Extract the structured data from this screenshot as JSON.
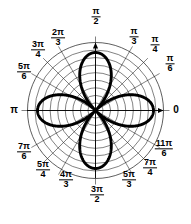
{
  "figure": {
    "title": "",
    "kind": "polar-rose-plot"
  },
  "axis_labels": [
    {
      "name": "angle-label-0",
      "text_type": "plain",
      "text": "0",
      "angle_deg": 0,
      "x": 176,
      "y": 110
    },
    {
      "name": "angle-label-pi-6",
      "text_type": "frac",
      "num": "π",
      "den": "6",
      "angle_deg": 30,
      "x": 170,
      "y": 64
    },
    {
      "name": "angle-label-pi-4",
      "text_type": "frac",
      "num": "π",
      "den": "4",
      "angle_deg": 45,
      "x": 155,
      "y": 45
    },
    {
      "name": "angle-label-pi-3",
      "text_type": "frac",
      "num": "π",
      "den": "3",
      "angle_deg": 60,
      "x": 134,
      "y": 37
    },
    {
      "name": "angle-label-pi-2",
      "text_type": "frac",
      "num": "π",
      "den": "2",
      "angle_deg": 90,
      "x": 96,
      "y": 17
    },
    {
      "name": "angle-label-2pi-3",
      "text_type": "frac",
      "num": "2π",
      "den": "3",
      "angle_deg": 120,
      "x": 58,
      "y": 38
    },
    {
      "name": "angle-label-3pi-4",
      "text_type": "frac",
      "num": "3π",
      "den": "4",
      "angle_deg": 135,
      "x": 38,
      "y": 50
    },
    {
      "name": "angle-label-5pi-6",
      "text_type": "frac",
      "num": "5π",
      "den": "6",
      "angle_deg": 150,
      "x": 24,
      "y": 72
    },
    {
      "name": "angle-label-pi",
      "text_type": "plain",
      "text": "π",
      "angle_deg": 180,
      "x": 14,
      "y": 110
    },
    {
      "name": "angle-label-7pi-6",
      "text_type": "frac",
      "num": "7π",
      "den": "6",
      "angle_deg": 210,
      "x": 24,
      "y": 152
    },
    {
      "name": "angle-label-5pi-4",
      "text_type": "frac",
      "num": "5π",
      "den": "4",
      "angle_deg": 225,
      "x": 43,
      "y": 170
    },
    {
      "name": "angle-label-4pi-3",
      "text_type": "frac",
      "num": "4π",
      "den": "3",
      "angle_deg": 240,
      "x": 66,
      "y": 180
    },
    {
      "name": "angle-label-3pi-2",
      "text_type": "frac",
      "num": "3π",
      "den": "2",
      "angle_deg": 270,
      "x": 97,
      "y": 195
    },
    {
      "name": "angle-label-5pi-3",
      "text_type": "frac",
      "num": "5π",
      "den": "3",
      "angle_deg": 300,
      "x": 129,
      "y": 180
    },
    {
      "name": "angle-label-7pi-4",
      "text_type": "frac",
      "num": "7π",
      "den": "4",
      "angle_deg": 315,
      "x": 150,
      "y": 168
    },
    {
      "name": "angle-label-11pi-6",
      "text_type": "frac",
      "num": "11π",
      "den": "6",
      "angle_deg": 330,
      "x": 164,
      "y": 149
    }
  ],
  "chart_data": {
    "type": "line",
    "coordinate_system": "polar",
    "title": "",
    "xlabel": "",
    "ylabel": "",
    "equation": "r = a cos(2θ)",
    "petals": 4,
    "petal_axis_angles_deg": [
      0,
      90,
      180,
      270
    ],
    "r_max": 1.0,
    "theta_range_deg": [
      0,
      360
    ],
    "grid": {
      "show": true,
      "radial_circles": 9,
      "circle_radii_fraction": [
        0.111,
        0.222,
        0.333,
        0.444,
        0.556,
        0.667,
        0.778,
        0.889,
        1.0
      ],
      "angular_spokes_deg": [
        0,
        30,
        45,
        60,
        90,
        120,
        135,
        150,
        180,
        210,
        225,
        240,
        270,
        300,
        315,
        330
      ],
      "color": "#000000"
    },
    "axes": {
      "horizontal_arrow_right": true,
      "vertical_arrow_up": true,
      "origin_label": "0"
    },
    "legend": {
      "show": false
    },
    "series": [
      {
        "name": "rose",
        "curve": "r = cos(2theta)",
        "samples_theta_deg": [
          0,
          15,
          30,
          45,
          60,
          75,
          90,
          105,
          120,
          135,
          150,
          165,
          180,
          195,
          210,
          225,
          240,
          255,
          270,
          285,
          300,
          315,
          330,
          345,
          360
        ],
        "samples_r": [
          1.0,
          0.866,
          0.5,
          0.0,
          -0.5,
          -0.866,
          -1.0,
          -0.866,
          -0.5,
          0.0,
          0.5,
          0.866,
          1.0,
          0.866,
          0.5,
          0.0,
          -0.5,
          -0.866,
          -1.0,
          -0.866,
          -0.5,
          0.0,
          0.5,
          0.866,
          1.0
        ],
        "stroke": "#000000",
        "stroke_width": 3
      }
    ]
  },
  "colors": {
    "background": "#ffffff",
    "curve": "#000000",
    "grid": "#000000",
    "text": "#000000"
  }
}
